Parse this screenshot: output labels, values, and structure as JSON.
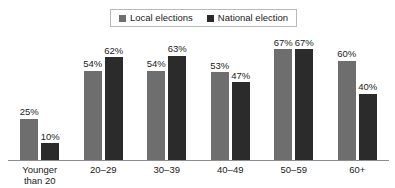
{
  "chart_data": {
    "type": "bar",
    "title": "",
    "xlabel": "",
    "ylabel": "",
    "ylim": [
      0,
      70
    ],
    "grid": false,
    "legend_position": "top-center",
    "value_suffix": "%",
    "categories": [
      "Younger than 20",
      "20–29",
      "30–39",
      "40–49",
      "50–59",
      "60+"
    ],
    "category_lines": [
      [
        "Younger",
        "than 20"
      ],
      [
        "20–29"
      ],
      [
        "30–39"
      ],
      [
        "40–49"
      ],
      [
        "50–59"
      ],
      [
        "60+"
      ]
    ],
    "series": [
      {
        "name": "Local elections",
        "color": "#6e6e6e",
        "values": [
          25,
          54,
          54,
          53,
          67,
          60
        ],
        "labels": [
          "25%",
          "54%",
          "54%",
          "53%",
          "67%",
          "60%"
        ]
      },
      {
        "name": "National election",
        "color": "#2b2b2b",
        "values": [
          10,
          62,
          63,
          47,
          67,
          40
        ],
        "labels": [
          "10%",
          "62%",
          "63%",
          "47%",
          "67%",
          "40%"
        ]
      }
    ]
  },
  "legend": {
    "items": [
      {
        "label": "Local elections",
        "color": "#6e6e6e"
      },
      {
        "label": "National election",
        "color": "#2b2b2b"
      }
    ]
  },
  "axis": {
    "baseline_color": "#8d8d8d"
  }
}
